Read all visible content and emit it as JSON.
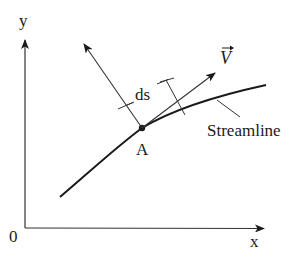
{
  "diagram": {
    "axes": {
      "y_label": "y",
      "x_label": "x",
      "origin_label": "0"
    },
    "labels": {
      "point": "A",
      "distance": "ds",
      "vector": "V",
      "curve": "Streamline"
    },
    "colors": {
      "line": "#1a1a1a",
      "thin_line": "#333333",
      "background": "#ffffff"
    }
  }
}
